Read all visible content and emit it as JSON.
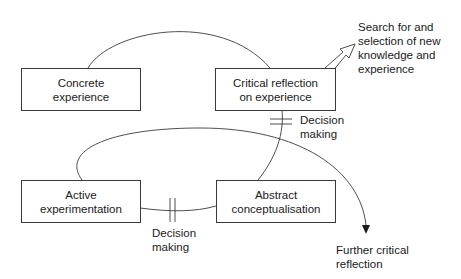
{
  "diagram": {
    "nodes": [
      {
        "id": "concrete",
        "label_line1": "Concrete",
        "label_line2": "experience"
      },
      {
        "id": "critical",
        "label_line1": "Critical reflection",
        "label_line2": "on experience"
      },
      {
        "id": "active",
        "label_line1": "Active",
        "label_line2": "experimentation"
      },
      {
        "id": "abstract",
        "label_line1": "Abstract",
        "label_line2": "conceptualisation"
      }
    ],
    "annotations": {
      "search": {
        "lines": [
          "Search for and",
          "selection of new",
          "knowledge and",
          "experience"
        ]
      },
      "decision_right": {
        "lines": [
          "Decision",
          "making"
        ]
      },
      "decision_bottom": {
        "lines": [
          "Decision",
          "making"
        ]
      },
      "further": {
        "lines": [
          "Further critical",
          "reflection"
        ]
      }
    },
    "edges": [
      {
        "from": "concrete",
        "to": "critical",
        "type": "curve"
      },
      {
        "from": "critical",
        "to": "abstract",
        "type": "curve",
        "marker": "decision-bar"
      },
      {
        "from": "abstract",
        "to": "active",
        "type": "line",
        "marker": "decision-bar"
      },
      {
        "from": "active",
        "to": "further",
        "type": "loop-arrow"
      },
      {
        "from": "critical",
        "to": "search",
        "type": "hollow-arrow"
      }
    ],
    "colors": {
      "stroke": "#3a3a3a",
      "text": "#1a1a1a",
      "background": "#ffffff"
    }
  }
}
